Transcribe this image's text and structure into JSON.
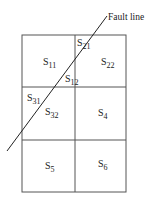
{
  "diagram": {
    "fault_label": "Fault line",
    "cells": [
      {
        "id": "s11",
        "base": "S",
        "sub": "11"
      },
      {
        "id": "s21",
        "base": "S",
        "sub": "21"
      },
      {
        "id": "s22",
        "base": "S",
        "sub": "22"
      },
      {
        "id": "s12",
        "base": "S",
        "sub": "12"
      },
      {
        "id": "s31",
        "base": "S",
        "sub": "31"
      },
      {
        "id": "s32",
        "base": "S",
        "sub": "32"
      },
      {
        "id": "s4",
        "base": "S",
        "sub": "4"
      },
      {
        "id": "s5",
        "base": "S",
        "sub": "5"
      },
      {
        "id": "s6",
        "base": "S",
        "sub": "6"
      }
    ],
    "colors": {
      "line": "#555555",
      "fault": "#222222",
      "text": "#222222"
    }
  }
}
